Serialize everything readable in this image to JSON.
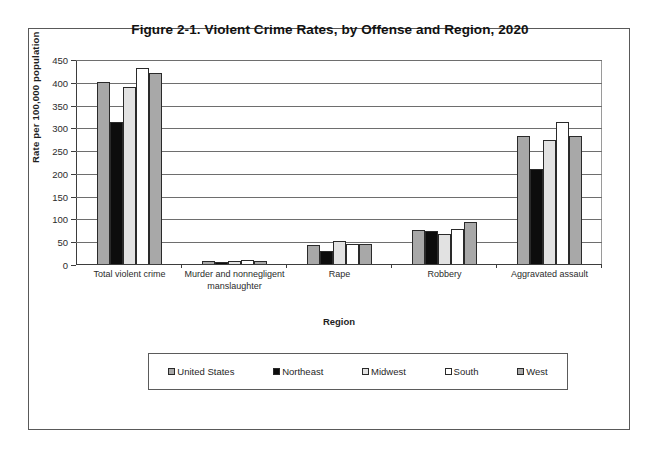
{
  "figure": {
    "title": "Figure 2-1. Violent Crime Rates, by Offense and Region, 2020"
  },
  "axes": {
    "y_title": "Rate per 100,000  population",
    "x_title": "Region",
    "y_ticks": [
      "0",
      "50",
      "100",
      "150",
      "200",
      "250",
      "300",
      "350",
      "400",
      "450"
    ]
  },
  "legend": {
    "entries": [
      {
        "label": "United States",
        "color": "#a8a8a8"
      },
      {
        "label": "Northeast",
        "color": "#0d0d0d"
      },
      {
        "label": "Midwest",
        "color": "#e2e2e2"
      },
      {
        "label": "South",
        "color": "#ffffff"
      },
      {
        "label": "West",
        "color": "#a8a8a8"
      }
    ]
  },
  "chart_data": {
    "type": "bar",
    "title": "Figure 2-1. Violent Crime Rates, by Offense and Region, 2020",
    "xlabel": "Region",
    "ylabel": "Rate per 100,000 population",
    "ylim": [
      0,
      450
    ],
    "ytick_step": 50,
    "grid": true,
    "legend_position": "bottom",
    "categories": [
      "Total violent crime",
      "Murder and nonnegligent manslaughter",
      "Rape",
      "Robbery",
      "Aggravated assault"
    ],
    "series": [
      {
        "name": "United States",
        "color": "#a8a8a8",
        "values": [
          399,
          6.5,
          41,
          74,
          280
        ]
      },
      {
        "name": "Northeast",
        "color": "#0d0d0d",
        "values": [
          312,
          4,
          29,
          72,
          208
        ]
      },
      {
        "name": "Midwest",
        "color": "#e2e2e2",
        "values": [
          389,
          7,
          50,
          65,
          272
        ]
      },
      {
        "name": "South",
        "color": "#ffffff",
        "values": [
          430,
          8,
          43,
          76,
          312
        ]
      },
      {
        "name": "West",
        "color": "#a8a8a8",
        "values": [
          420,
          6,
          45,
          93,
          280
        ]
      }
    ]
  }
}
